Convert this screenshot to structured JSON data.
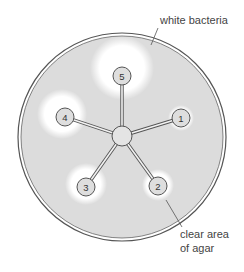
{
  "diagram": {
    "type": "agar-plate-antibiotic-disc-diagram",
    "plate": {
      "center": [
        122,
        137
      ],
      "radius": 103,
      "fill_color": "#dcdcdc",
      "rim_color": "#555555"
    },
    "hub": {
      "center": [
        122,
        136
      ],
      "radius": 10,
      "fill_color": "#e4e4e4"
    },
    "discs": [
      {
        "label": "1",
        "center": [
          181,
          118
        ],
        "radius": 9,
        "halo_center": [
          181,
          118
        ],
        "halo_radius": 13
      },
      {
        "label": "2",
        "center": [
          158,
          186
        ],
        "radius": 9,
        "halo_center": [
          158,
          185
        ],
        "halo_radius": 16
      },
      {
        "label": "3",
        "center": [
          86,
          187
        ],
        "radius": 9,
        "halo_center": [
          86,
          184
        ],
        "halo_radius": 21
      },
      {
        "label": "4",
        "center": [
          65,
          117
        ],
        "radius": 9,
        "halo_center": [
          62,
          114
        ],
        "halo_radius": 25
      },
      {
        "label": "5",
        "center": [
          122,
          76
        ],
        "radius": 9,
        "halo_center": [
          122,
          68
        ],
        "halo_radius": 32
      }
    ],
    "annotations": [
      {
        "lines": [
          "white bacteria"
        ],
        "text_pos": [
          160,
          24
        ],
        "leader": [
          [
            158,
            28
          ],
          [
            151,
            45
          ]
        ]
      },
      {
        "lines": [
          "clear area",
          "of agar"
        ],
        "text_pos": [
          180,
          238
        ],
        "leader": [
          [
            166,
            200
          ],
          [
            182,
            227
          ]
        ]
      }
    ],
    "colors": {
      "background": "#ffffff",
      "agar_bacteria": "#dcdcdc",
      "clear_zone": "#ffffff",
      "disc_fill": "#dedede",
      "outline": "#555555",
      "text": "#444444"
    }
  }
}
